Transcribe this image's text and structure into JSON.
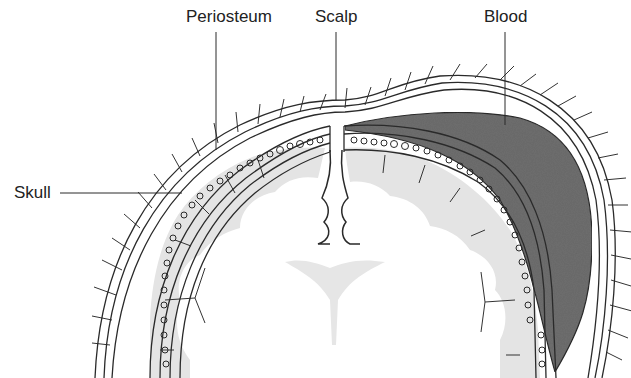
{
  "diagram": {
    "type": "anatomical-cross-section",
    "labels": {
      "periosteum": "Periosteum",
      "scalp": "Scalp",
      "blood": "Blood",
      "skull": "Skull"
    },
    "colors": {
      "line": "#2a2a2a",
      "blood_fill": "#6e6e6e",
      "brain_gray": "#e2e2e2",
      "background": "#ffffff"
    }
  }
}
